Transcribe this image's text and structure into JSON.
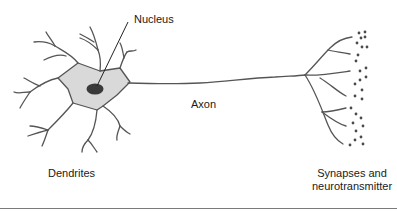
{
  "diagram": {
    "type": "neuron",
    "labels": {
      "nucleus": "Nucleus",
      "axon": "Axon",
      "dendrites": "Dendrites",
      "synapses_line1": "Synapses and",
      "synapses_line2": "neurotransmitter"
    },
    "colors": {
      "stroke": "#555555",
      "cell_body_fill": "#d9d9d9",
      "nucleus_fill": "#3a3a3a",
      "pointer_line": "#222222",
      "rule": "#7a7a7a"
    }
  }
}
